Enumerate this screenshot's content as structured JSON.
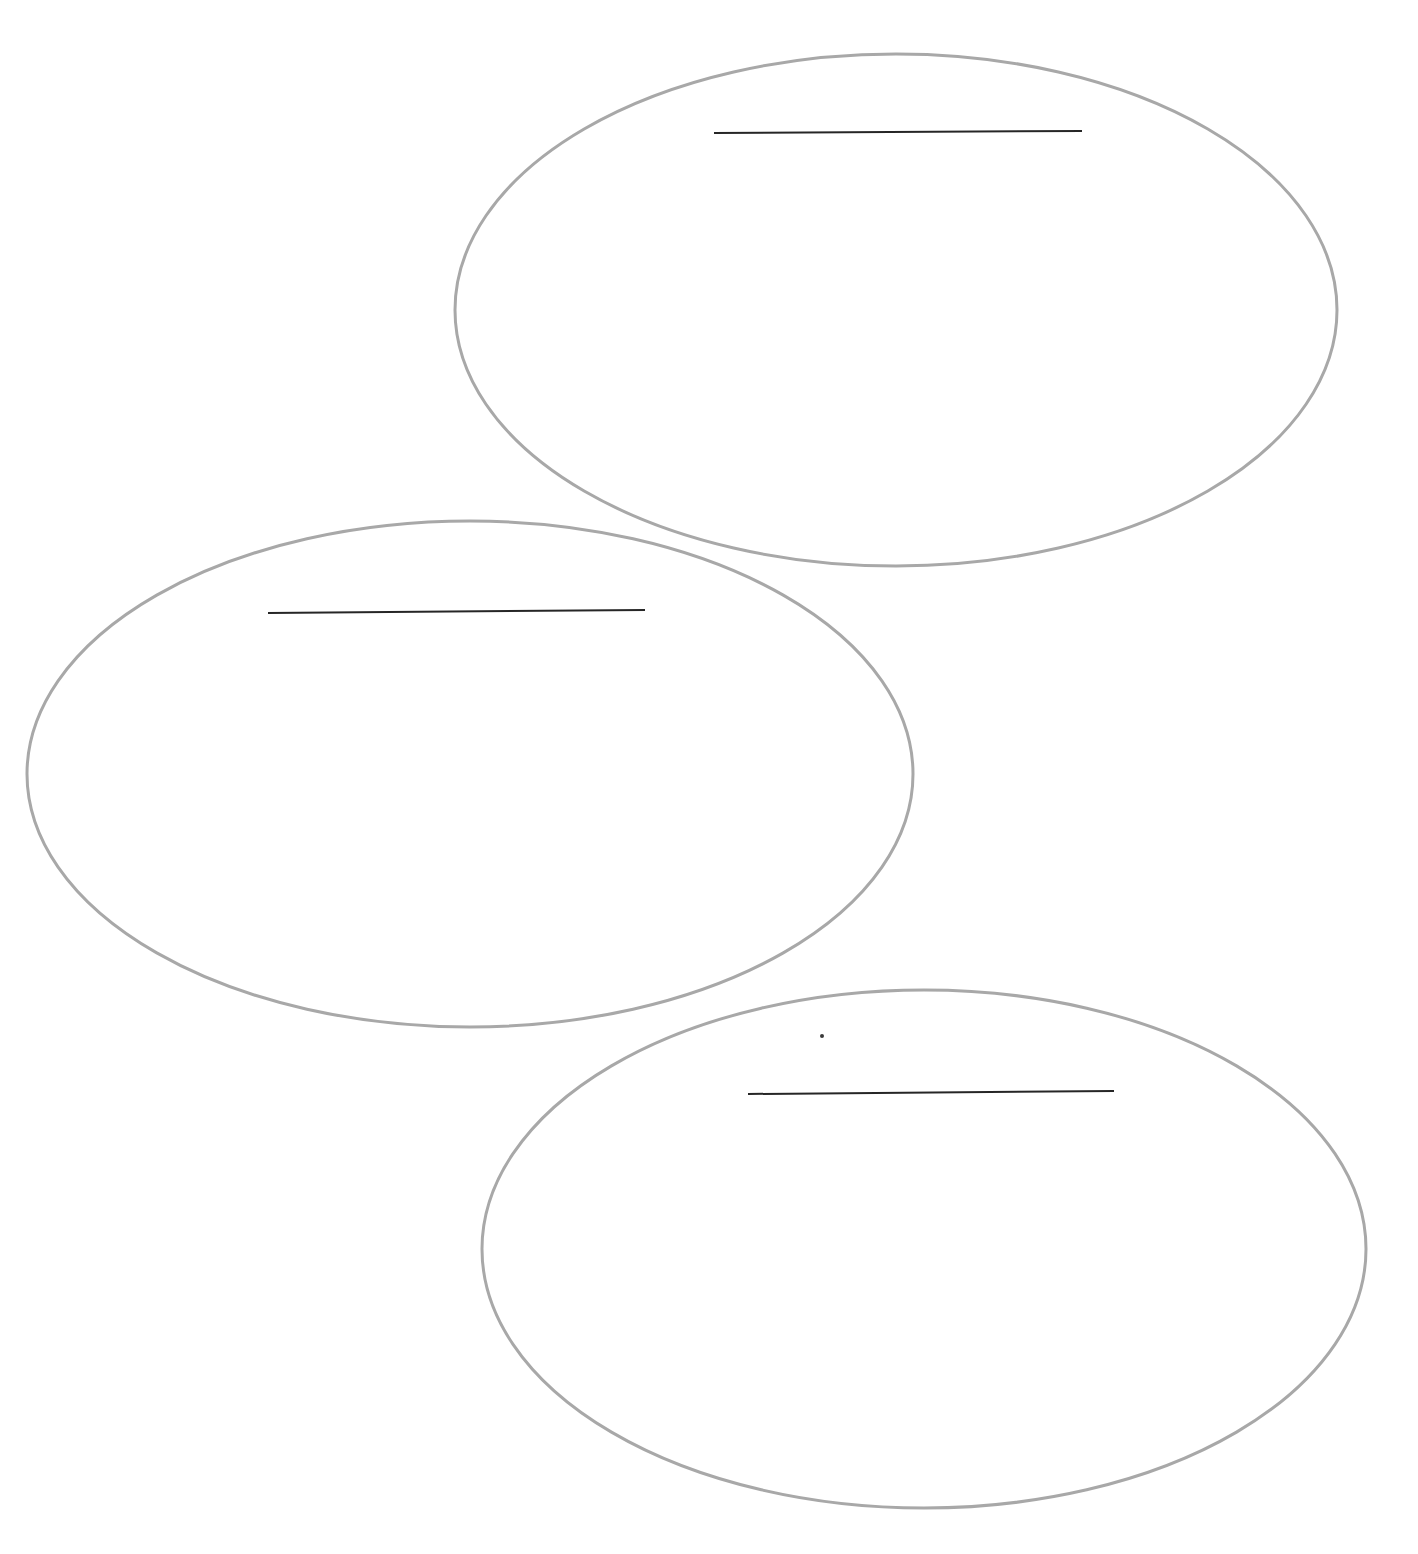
{
  "page": {
    "background_color": "#ffffff",
    "width": 1418,
    "height": 1554,
    "orientation": "portrait"
  },
  "style": {
    "oval_stroke_color": "#a8a8a8",
    "oval_stroke_width": 3,
    "oval_fill": "none",
    "rule_line_color": "#262626",
    "rule_line_width": 2,
    "dot_color": "#3a3a3a"
  },
  "shapes": {
    "ovals": [
      {
        "id": "oval-top-right",
        "label": "Top right oval",
        "cx": 896,
        "cy": 310,
        "rx": 441,
        "ry": 256,
        "bounds": {
          "left": 455,
          "top": 54,
          "right": 1337,
          "bottom": 566
        }
      },
      {
        "id": "oval-middle-left",
        "label": "Middle left oval",
        "cx": 470,
        "cy": 774,
        "rx": 443,
        "ry": 253,
        "bounds": {
          "left": 27,
          "top": 521,
          "right": 913,
          "bottom": 1027
        }
      },
      {
        "id": "oval-bottom-right",
        "label": "Bottom right oval",
        "cx": 924,
        "cy": 1249,
        "rx": 442,
        "ry": 259,
        "bounds": {
          "left": 482,
          "top": 990,
          "right": 1366,
          "bottom": 1508
        }
      }
    ],
    "rule_lines": [
      {
        "id": "write-line-top",
        "label": "Top oval answer line",
        "x1": 714,
        "y1": 133,
        "x2": 1082,
        "y2": 131,
        "length": 368,
        "value": "",
        "placeholder": ""
      },
      {
        "id": "write-line-middle",
        "label": "Middle oval answer line",
        "x1": 268,
        "y1": 613,
        "x2": 645,
        "y2": 610,
        "length": 377,
        "value": "",
        "placeholder": ""
      },
      {
        "id": "write-line-bottom",
        "label": "Bottom oval answer line",
        "x1": 748,
        "y1": 1094,
        "x2": 1114,
        "y2": 1091,
        "length": 366,
        "value": "",
        "placeholder": ""
      }
    ],
    "marks": [
      {
        "id": "stray-dot",
        "label": "Stray ink dot",
        "cx": 822,
        "cy": 1036,
        "r": 2
      }
    ]
  },
  "text": {
    "heading": "",
    "instructions": "",
    "footer": "",
    "oval_labels": [
      "",
      "",
      ""
    ]
  }
}
